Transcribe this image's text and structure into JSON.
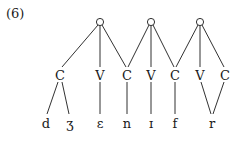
{
  "example_number": "(6)",
  "syllables": [
    {
      "id": "s1",
      "symbol": "o",
      "x": 100,
      "y": 22
    },
    {
      "id": "s2",
      "symbol": "o",
      "x": 151,
      "y": 22
    },
    {
      "id": "s3",
      "symbol": "o",
      "x": 200,
      "y": 22
    }
  ],
  "skeleton": [
    {
      "id": "x1",
      "label": "C",
      "x": 60
    },
    {
      "id": "x2",
      "label": "V",
      "x": 100
    },
    {
      "id": "x3",
      "label": "C",
      "x": 127
    },
    {
      "id": "x4",
      "label": "V",
      "x": 151
    },
    {
      "id": "x5",
      "label": "C",
      "x": 175
    },
    {
      "id": "x6",
      "label": "V",
      "x": 200
    },
    {
      "id": "x7",
      "label": "C",
      "x": 225
    }
  ],
  "segments": [
    {
      "id": "d",
      "label": "d",
      "x": 46
    },
    {
      "id": "zh",
      "label": "ʒ",
      "x": 70
    },
    {
      "id": "eps",
      "label": "ɛ",
      "x": 100
    },
    {
      "id": "n",
      "label": "n",
      "x": 127
    },
    {
      "id": "iota",
      "label": "ɪ",
      "x": 151
    },
    {
      "id": "f",
      "label": "f",
      "x": 175
    },
    {
      "id": "r",
      "label": "r",
      "x": 212
    }
  ]
}
